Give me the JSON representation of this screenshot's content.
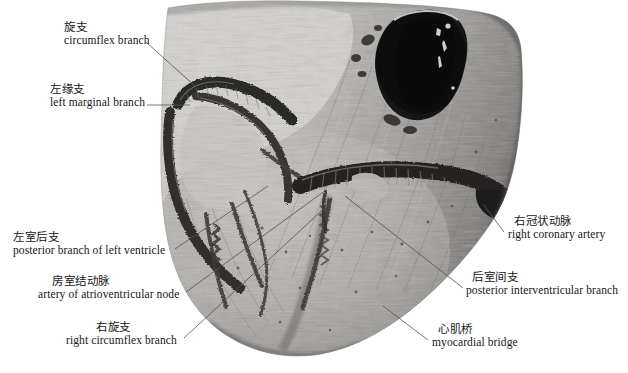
{
  "figure": {
    "kind": "anatomical-photograph",
    "width_px": 628,
    "height_px": 373,
    "background_color": "#ffffff",
    "photo_tone": "grayscale"
  },
  "labels": [
    {
      "id": "circumflex-branch",
      "zh": "旋支",
      "en": "circumflex branch",
      "x": 64,
      "y": 22,
      "indent": "none",
      "leader": {
        "x1": 146,
        "y1": 42,
        "x2": 196,
        "y2": 87
      }
    },
    {
      "id": "left-marginal-branch",
      "zh": "左缘支",
      "en": "left marginal branch",
      "x": 50,
      "y": 84,
      "indent": "none",
      "leader": {
        "x1": 147,
        "y1": 105,
        "x2": 190,
        "y2": 105
      }
    },
    {
      "id": "posterior-branch-of-left-ventricle",
      "zh": "左室后支",
      "en": "posterior branch of left ventricle",
      "x": 13,
      "y": 232,
      "indent": "none",
      "leader": {
        "x1": 175,
        "y1": 249,
        "x2": 268,
        "y2": 186
      }
    },
    {
      "id": "artery-of-atrioventricular-node",
      "zh": "房室结动脉",
      "en": "artery of atrioventricular node",
      "x": 38,
      "y": 276,
      "indent": "indent-1",
      "leader": {
        "x1": 186,
        "y1": 292,
        "x2": 326,
        "y2": 190
      }
    },
    {
      "id": "right-circumflex-branch",
      "zh": "右旋支",
      "en": "right circumflex branch",
      "x": 66,
      "y": 322,
      "indent": "indent-2",
      "leader": {
        "x1": 184,
        "y1": 338,
        "x2": 330,
        "y2": 203
      }
    },
    {
      "id": "right-coronary-artery",
      "zh": "右冠状动脉",
      "en": "right coronary artery",
      "x": 508,
      "y": 216,
      "indent": "indent-r",
      "leader": {
        "x1": 504,
        "y1": 232,
        "x2": 483,
        "y2": 204
      }
    },
    {
      "id": "posterior-interventricular-branch",
      "zh": "后室间支",
      "en": "posterior interventricular branch",
      "x": 466,
      "y": 272,
      "indent": "indent-r",
      "leader": {
        "x1": 463,
        "y1": 288,
        "x2": 345,
        "y2": 196
      }
    },
    {
      "id": "myocardial-bridge",
      "zh": "心肌桥",
      "en": "myocardial bridge",
      "x": 432,
      "y": 324,
      "indent": "indent-r",
      "leader": {
        "x1": 428,
        "y1": 340,
        "x2": 383,
        "y2": 306
      }
    }
  ]
}
